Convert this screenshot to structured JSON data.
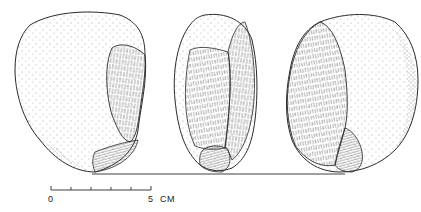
{
  "figure": {
    "views": [
      {
        "name": "view-left",
        "description": "cortex face with flake scar on right side"
      },
      {
        "name": "view-center",
        "description": "profile view showing flaked face"
      },
      {
        "name": "view-right",
        "description": "opposite face with flake scar on left side"
      }
    ],
    "scale_bar": {
      "start_label": "0",
      "end_label": "5",
      "unit_label": "CM",
      "ticks": 6
    },
    "colors": {
      "ink": "#2a2a2a",
      "paper": "#ffffff"
    }
  }
}
